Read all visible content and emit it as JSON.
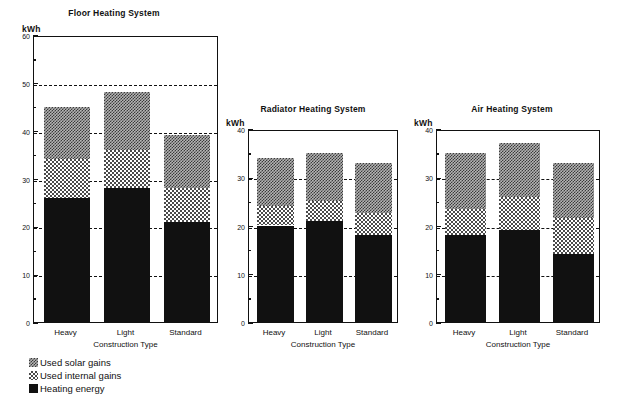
{
  "figure": {
    "unit_label": "kWh",
    "xaxis_title": "Construction Type"
  },
  "legend": {
    "items": [
      {
        "label": "Used solar gains",
        "swatch": "solar-pattern-swatch"
      },
      {
        "label": "Used internal gains",
        "swatch": "internal-pattern-swatch"
      },
      {
        "label": "Heating energy",
        "swatch": "heating-solid-swatch"
      }
    ]
  },
  "chart_data": [
    {
      "type": "bar",
      "stacked": true,
      "title": "Floor Heating System",
      "xlabel": "Construction Type",
      "ylabel": "kWh",
      "categories": [
        "Heavy",
        "Light",
        "Standard"
      ],
      "ylim": [
        0,
        60
      ],
      "yticks": [
        0,
        10,
        20,
        30,
        40,
        50,
        60
      ],
      "yticklabels": [
        "0",
        "10",
        "20",
        "30",
        "40",
        "50",
        "60"
      ],
      "yminorticks": [
        5,
        15,
        25,
        35,
        45,
        55
      ],
      "grid": "dashed-horizontal-at-major-ticks",
      "legend_position": "below-figure-left",
      "series": [
        {
          "name": "Heating energy",
          "values": [
            26,
            28,
            21
          ]
        },
        {
          "name": "Used internal gains",
          "values": [
            8,
            8,
            7
          ]
        },
        {
          "name": "Used solar gains",
          "values": [
            11,
            12,
            11
          ]
        }
      ],
      "cumulative_tops": [
        {
          "category": "Heavy",
          "heating": 26,
          "internal_top": 34,
          "total": 45
        },
        {
          "category": "Light",
          "heating": 28,
          "internal_top": 36,
          "total": 48
        },
        {
          "category": "Standard",
          "heating": 21,
          "internal_top": 28,
          "total": 39
        }
      ]
    },
    {
      "type": "bar",
      "stacked": true,
      "title": "Radiator Heating System",
      "xlabel": "Construction Type",
      "ylabel": "kWh",
      "categories": [
        "Heavy",
        "Light",
        "Standard"
      ],
      "ylim": [
        0,
        40
      ],
      "yticks": [
        0,
        10,
        20,
        30,
        40
      ],
      "yticklabels": [
        "0",
        "10",
        "20",
        "30",
        "40"
      ],
      "yminorticks": [
        5,
        15,
        25,
        35
      ],
      "grid": "dashed-horizontal-at-major-ticks",
      "series": [
        {
          "name": "Heating energy",
          "values": [
            20,
            21,
            18
          ]
        },
        {
          "name": "Used internal gains",
          "values": [
            4,
            4,
            4.5
          ]
        },
        {
          "name": "Used solar gains",
          "values": [
            10,
            10,
            10.5
          ]
        }
      ],
      "cumulative_tops": [
        {
          "category": "Heavy",
          "heating": 20,
          "internal_top": 24,
          "total": 34
        },
        {
          "category": "Light",
          "heating": 21,
          "internal_top": 25,
          "total": 35
        },
        {
          "category": "Standard",
          "heating": 18,
          "internal_top": 22.5,
          "total": 33
        }
      ]
    },
    {
      "type": "bar",
      "stacked": true,
      "title": "Air Heating System",
      "xlabel": "Construction Type",
      "ylabel": "kWh",
      "categories": [
        "Heavy",
        "Light",
        "Standard"
      ],
      "ylim": [
        0,
        40
      ],
      "yticks": [
        0,
        10,
        20,
        30,
        40
      ],
      "yticklabels": [
        "0",
        "10",
        "20",
        "30",
        "40"
      ],
      "yminorticks": [
        5,
        15,
        25,
        35
      ],
      "grid": "dashed-horizontal-at-major-ticks",
      "series": [
        {
          "name": "Heating energy",
          "values": [
            18,
            19,
            14
          ]
        },
        {
          "name": "Used internal gains",
          "values": [
            5.5,
            7,
            7.5
          ]
        },
        {
          "name": "Used solar gains",
          "values": [
            11.5,
            11,
            11.5
          ]
        }
      ],
      "cumulative_tops": [
        {
          "category": "Heavy",
          "heating": 18,
          "internal_top": 23.5,
          "total": 35
        },
        {
          "category": "Light",
          "heating": 19,
          "internal_top": 26,
          "total": 37
        },
        {
          "category": "Standard",
          "heating": 14,
          "internal_top": 21.5,
          "total": 33
        }
      ]
    }
  ]
}
